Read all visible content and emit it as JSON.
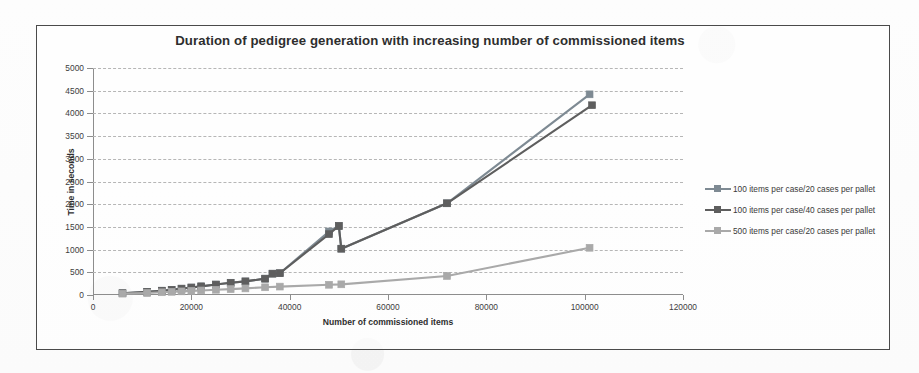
{
  "chart": {
    "title": "Duration of pedigree generation with increasing number of commissioned items",
    "xlabel": "Number of commissioned items",
    "ylabel": "Time in seconds"
  },
  "legend": {
    "items": [
      {
        "label": "100 items per case/20 cases per pallet",
        "color": "#7e8a93",
        "marker": "marker-square"
      },
      {
        "label": "100 items per case/40 cases per pallet",
        "color": "#5e5e5e",
        "marker": "marker-square"
      },
      {
        "label": "500 items per case/20 cases per pallet",
        "color": "#a9a9a9",
        "marker": "marker-square"
      }
    ]
  },
  "chart_data": {
    "type": "line",
    "title": "Duration of pedigree generation with increasing number of commissioned items",
    "xlabel": "Number of commissioned items",
    "ylabel": "Time in seconds",
    "xlim": [
      0,
      120000
    ],
    "ylim": [
      0,
      5000
    ],
    "xticks": [
      0,
      20000,
      40000,
      60000,
      80000,
      100000,
      120000
    ],
    "yticks": [
      0,
      500,
      1000,
      1500,
      2000,
      2500,
      3000,
      3500,
      4000,
      4500,
      5000
    ],
    "grid": true,
    "legend_position": "right",
    "series": [
      {
        "name": "100 items per case/20 cases per pallet",
        "color": "#7e8a93",
        "points": [
          [
            6000,
            40
          ],
          [
            11000,
            70
          ],
          [
            14000,
            95
          ],
          [
            16000,
            115
          ],
          [
            18000,
            140
          ],
          [
            20000,
            165
          ],
          [
            22000,
            190
          ],
          [
            25000,
            230
          ],
          [
            28000,
            270
          ],
          [
            31000,
            300
          ],
          [
            35000,
            360
          ],
          [
            36500,
            470
          ],
          [
            38000,
            480
          ],
          [
            48000,
            1400
          ],
          [
            50000,
            1520
          ],
          [
            50500,
            1020
          ],
          [
            72000,
            2020
          ],
          [
            101000,
            4420
          ]
        ]
      },
      {
        "name": "100 items per case/40 cases per pallet",
        "color": "#5e5e5e",
        "points": [
          [
            6000,
            40
          ],
          [
            11000,
            70
          ],
          [
            14000,
            95
          ],
          [
            16000,
            115
          ],
          [
            18000,
            140
          ],
          [
            20000,
            165
          ],
          [
            22000,
            190
          ],
          [
            25000,
            230
          ],
          [
            28000,
            270
          ],
          [
            31000,
            300
          ],
          [
            35000,
            360
          ],
          [
            36500,
            470
          ],
          [
            38000,
            480
          ],
          [
            48000,
            1340
          ],
          [
            50000,
            1520
          ],
          [
            50500,
            1020
          ],
          [
            72000,
            2020
          ],
          [
            101500,
            4180
          ]
        ]
      },
      {
        "name": "500 items per case/20 cases per pallet",
        "color": "#a9a9a9",
        "points": [
          [
            6000,
            30
          ],
          [
            11000,
            45
          ],
          [
            14000,
            60
          ],
          [
            16000,
            70
          ],
          [
            18000,
            80
          ],
          [
            20000,
            90
          ],
          [
            22000,
            100
          ],
          [
            25000,
            115
          ],
          [
            28000,
            130
          ],
          [
            31000,
            145
          ],
          [
            35000,
            170
          ],
          [
            38000,
            185
          ],
          [
            48000,
            225
          ],
          [
            50500,
            235
          ],
          [
            72000,
            420
          ],
          [
            101000,
            1040
          ]
        ]
      }
    ]
  }
}
